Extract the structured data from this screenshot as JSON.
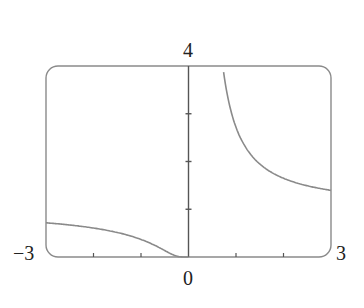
{
  "chart_data": {
    "type": "line",
    "title": "",
    "function": "y = e^(1/x)",
    "xlabel": "",
    "ylabel": "",
    "xlim": [
      -3,
      3
    ],
    "ylim": [
      0,
      4
    ],
    "grid": false,
    "legend": null,
    "frame": "rounded-rectangle",
    "x_tick_labels": [
      "-3",
      "0",
      "3"
    ],
    "y_tick_labels": [
      "4"
    ],
    "x_ticks": [
      -3,
      -2,
      -1,
      0,
      1,
      2,
      3
    ],
    "y_ticks": [
      0,
      1,
      2,
      3,
      4
    ],
    "series": [
      {
        "name": "left branch",
        "x": [
          -3,
          -2.5,
          -2,
          -1.5,
          -1,
          -0.75,
          -0.5,
          -0.3,
          -0.15,
          0
        ],
        "y": [
          0.72,
          0.67,
          0.61,
          0.51,
          0.37,
          0.26,
          0.14,
          0.04,
          0.0,
          0
        ]
      },
      {
        "name": "right branch",
        "x": [
          0.72,
          0.8,
          0.94,
          1.0,
          1.23,
          1.5,
          1.78,
          2.0,
          2.5,
          3.0
        ],
        "y": [
          4.0,
          3.49,
          2.9,
          2.72,
          2.25,
          1.95,
          1.75,
          1.65,
          1.49,
          1.4
        ]
      }
    ],
    "colors": {
      "curve": "#8a8a8a",
      "axis": "#555555",
      "frame": "#8a8a8a"
    }
  },
  "labels": {
    "y_max": "4",
    "x_min": "−3",
    "x_max": "3",
    "origin": "0"
  }
}
